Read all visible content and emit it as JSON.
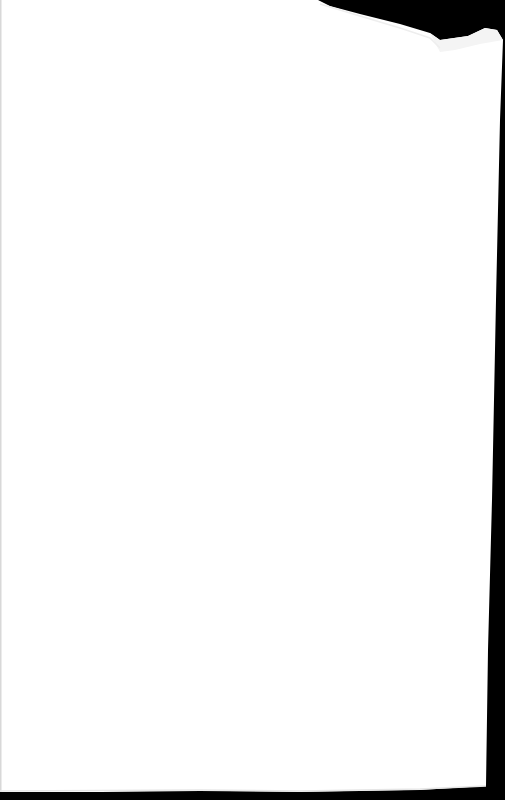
{
  "document": {
    "type": "scanned-page",
    "content": "",
    "colors": {
      "paper": "#ffffff",
      "background": "#000000",
      "fold_shadow": "#f2f2f2",
      "left_edge": "#d8d8d8"
    }
  }
}
